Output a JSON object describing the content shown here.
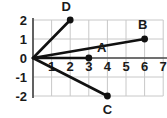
{
  "chart_data": {
    "type": "scatter",
    "title": "",
    "xlabel": "",
    "ylabel": "",
    "xlim": [
      0,
      7
    ],
    "ylim": [
      -2,
      2
    ],
    "grid": true,
    "legend": "none",
    "x_ticks": [
      "1",
      "2",
      "3",
      "4",
      "5",
      "6",
      "7"
    ],
    "x_tick_values": [
      1,
      2,
      3,
      4,
      5,
      6,
      7
    ],
    "y_ticks": [
      "2",
      "1",
      "0",
      "-1",
      "-2"
    ],
    "y_tick_values": [
      2,
      1,
      0,
      -1,
      -2
    ],
    "origin_label": "0",
    "points": [
      {
        "label": "A",
        "x": 3,
        "y": 0,
        "label_dx": 0.7,
        "label_dy": 0.55
      },
      {
        "label": "B",
        "x": 6,
        "y": 1,
        "label_dx": -0.1,
        "label_dy": 0.72
      },
      {
        "label": "C",
        "x": 4,
        "y": -2,
        "label_dx": 0.0,
        "label_dy": -0.72
      },
      {
        "label": "D",
        "x": 2,
        "y": 2,
        "label_dx": -0.22,
        "label_dy": 0.68
      }
    ],
    "rays": [
      {
        "name": "ray-to-D",
        "from": [
          0,
          0
        ],
        "to": [
          2,
          2
        ]
      },
      {
        "name": "ray-to-B",
        "from": [
          0,
          0
        ],
        "to": [
          6,
          1
        ]
      },
      {
        "name": "ray-to-A",
        "from": [
          0,
          0
        ],
        "to": [
          3,
          0
        ]
      },
      {
        "name": "ray-to-C",
        "from": [
          0,
          0
        ],
        "to": [
          4,
          -2
        ]
      }
    ],
    "colors": {
      "grid": "#c8c8c8",
      "axis": "#4a4a4a",
      "ray": "#111111",
      "point": "#111111",
      "text": "#1a1a1a",
      "background": "#ffffff"
    }
  }
}
